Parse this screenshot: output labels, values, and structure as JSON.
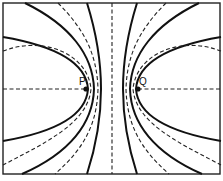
{
  "figure": {
    "points": [
      {
        "id": "P",
        "label": "P"
      },
      {
        "id": "Q",
        "label": "Q"
      }
    ],
    "line_styles": {
      "solid": "solid curves",
      "dashed": "dashed curves"
    },
    "colors": {
      "ink": "#111111",
      "background": "#ffffff"
    }
  }
}
